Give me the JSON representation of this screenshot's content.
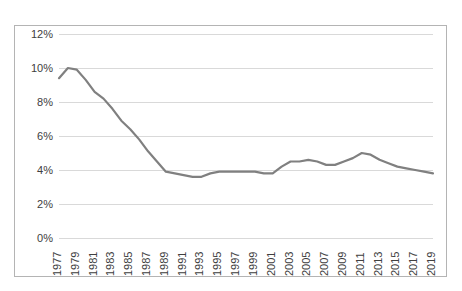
{
  "chart_data": {
    "type": "line",
    "title": "",
    "subtitle": "",
    "xlabel": "",
    "ylabel": "",
    "legend": [],
    "legend_position": "none",
    "grid": true,
    "xlim": [
      1977,
      2019
    ],
    "ylim": [
      0,
      12
    ],
    "y_tick_labels": [
      "12%",
      "10%",
      "8%",
      "6%",
      "4%",
      "2%",
      "0%"
    ],
    "y_tick_values": [
      12,
      10,
      8,
      6,
      4,
      2,
      0
    ],
    "y_tick_step": 2,
    "x_tick_labels": [
      "1977",
      "1979",
      "1981",
      "1983",
      "1985",
      "1987",
      "1989",
      "1991",
      "1993",
      "1995",
      "1997",
      "1999",
      "2001",
      "2003",
      "2005",
      "2007",
      "2009",
      "2011",
      "2013",
      "2015",
      "2017",
      "2019"
    ],
    "x_tick_step": 2,
    "x_label_rotation": -90,
    "line_color": "#808080",
    "line_width": 2.2,
    "grid_color": "#d9d9d9",
    "border_color": "#b4b4b4",
    "background_color": "#ffffff",
    "markers": false,
    "x": [
      1977,
      1978,
      1979,
      1980,
      1981,
      1982,
      1983,
      1984,
      1985,
      1986,
      1987,
      1988,
      1989,
      1990,
      1991,
      1992,
      1993,
      1994,
      1995,
      1996,
      1997,
      1998,
      1999,
      2000,
      2001,
      2002,
      2003,
      2004,
      2005,
      2006,
      2007,
      2008,
      2009,
      2010,
      2011,
      2012,
      2013,
      2014,
      2015,
      2016,
      2017,
      2018,
      2019
    ],
    "values": [
      9.4,
      10.0,
      9.9,
      9.3,
      8.6,
      8.2,
      7.6,
      6.9,
      6.4,
      5.8,
      5.1,
      4.5,
      3.9,
      3.8,
      3.7,
      3.6,
      3.6,
      3.8,
      3.9,
      3.9,
      3.9,
      3.9,
      3.9,
      3.8,
      3.8,
      4.2,
      4.5,
      4.5,
      4.6,
      4.5,
      4.3,
      4.3,
      4.5,
      4.7,
      5.0,
      4.9,
      4.6,
      4.4,
      4.2,
      4.1,
      4.0,
      3.9,
      3.8
    ]
  }
}
